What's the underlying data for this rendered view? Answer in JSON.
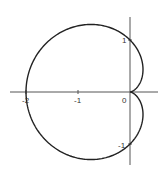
{
  "chart_data": {
    "type": "line",
    "title": "",
    "xlabel": "",
    "ylabel": "",
    "equation": "r = 1 - cos(theta)",
    "xlim": [
      -2.3,
      0.55
    ],
    "ylim": [
      -1.45,
      1.45
    ],
    "grid": false,
    "legend": null,
    "x_ticks": [
      {
        "value": -2,
        "label": "-2"
      },
      {
        "value": -1,
        "label": "-1"
      },
      {
        "value": 0,
        "label": "0"
      }
    ],
    "y_ticks": [
      {
        "value": 1,
        "label": "1"
      },
      {
        "value": -1,
        "label": "-1"
      }
    ],
    "key_points": [
      {
        "x": 0,
        "y": 0,
        "note": "cusp"
      },
      {
        "x": -2,
        "y": 0
      },
      {
        "x": 0,
        "y": 1
      },
      {
        "x": 0,
        "y": -1
      },
      {
        "x": -0.75,
        "y": 1.299
      },
      {
        "x": -0.75,
        "y": -1.299
      }
    ],
    "colors": {
      "curve": "#222222",
      "axes": "#444444"
    }
  },
  "labels": {
    "x_neg2": "-2",
    "x_neg1": "-1",
    "origin": "0",
    "y_pos1": "1",
    "y_neg1": "-1"
  }
}
